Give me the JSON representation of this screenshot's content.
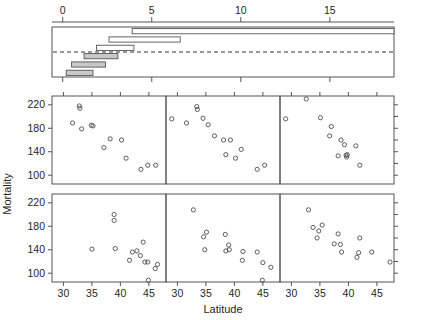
{
  "figure": {
    "type": "statistical-trellis-figure",
    "ylabel": "Mortality",
    "xlabel": "Latitude"
  },
  "chart_data": [
    {
      "type": "bar",
      "name": "interval-panel",
      "title": "",
      "xlabel": "",
      "ylabel": "",
      "xlim": [
        -0.6,
        18.6
      ],
      "xticks": [
        0,
        5,
        10,
        15
      ],
      "xtick_labels": [
        "0",
        "5",
        "10",
        "15"
      ],
      "grid": false,
      "reference_line": 3.5,
      "orientation": "horizontal",
      "note": "horizontal interval bars, three open above reference line and three shaded below",
      "categories": [
        "bar-1",
        "bar-2",
        "bar-3",
        "bar-4",
        "bar-5",
        "bar-6"
      ],
      "bars": [
        {
          "label": "bar-1",
          "row": 1,
          "start": 3.9,
          "end": 18.6,
          "filled": false
        },
        {
          "label": "bar-2",
          "row": 2,
          "start": 2.6,
          "end": 6.6,
          "filled": false
        },
        {
          "label": "bar-3",
          "row": 3,
          "start": 1.9,
          "end": 4.0,
          "filled": false
        },
        {
          "label": "bar-4",
          "row": 4,
          "start": 1.2,
          "end": 3.1,
          "filled": true
        },
        {
          "label": "bar-5",
          "row": 5,
          "start": 0.5,
          "end": 2.4,
          "filled": true
        },
        {
          "label": "bar-6",
          "row": 6,
          "start": 0.2,
          "end": 1.7,
          "filled": true
        }
      ]
    },
    {
      "type": "scatter",
      "name": "panel-top-left",
      "xlabel": "",
      "ylabel": "Mortality",
      "xlim": [
        28,
        48
      ],
      "ylim": [
        85,
        235
      ],
      "yticks": [
        100,
        140,
        180,
        220
      ],
      "ytick_labels": [
        "100",
        "140",
        "180",
        "220"
      ],
      "xticks": [
        30,
        35,
        40,
        45
      ],
      "xtick_labels": [
        "",
        "",
        "",
        ""
      ],
      "grid": false,
      "points": [
        {
          "x": 32.8,
          "y": 218
        },
        {
          "x": 32.9,
          "y": 214
        },
        {
          "x": 31.6,
          "y": 189
        },
        {
          "x": 33.2,
          "y": 179
        },
        {
          "x": 34.9,
          "y": 185
        },
        {
          "x": 35.2,
          "y": 184
        },
        {
          "x": 37.1,
          "y": 147
        },
        {
          "x": 38.2,
          "y": 162
        },
        {
          "x": 40.2,
          "y": 160
        },
        {
          "x": 41.0,
          "y": 129
        },
        {
          "x": 43.6,
          "y": 110
        },
        {
          "x": 44.8,
          "y": 117
        },
        {
          "x": 46.2,
          "y": 117
        }
      ]
    },
    {
      "type": "scatter",
      "name": "panel-top-middle",
      "xlabel": "",
      "ylabel": "",
      "xlim": [
        28,
        48
      ],
      "ylim": [
        85,
        235
      ],
      "yticks": [
        100,
        140,
        180,
        220
      ],
      "ytick_labels": [
        "",
        "",
        "",
        ""
      ],
      "xticks": [
        30,
        35,
        40,
        45
      ],
      "xtick_labels": [
        "",
        "",
        "",
        ""
      ],
      "grid": false,
      "points": [
        {
          "x": 33.4,
          "y": 217
        },
        {
          "x": 33.5,
          "y": 212
        },
        {
          "x": 29.0,
          "y": 196
        },
        {
          "x": 31.6,
          "y": 189
        },
        {
          "x": 34.5,
          "y": 197
        },
        {
          "x": 35.4,
          "y": 186
        },
        {
          "x": 36.5,
          "y": 167
        },
        {
          "x": 38.1,
          "y": 160
        },
        {
          "x": 38.5,
          "y": 135
        },
        {
          "x": 39.3,
          "y": 160
        },
        {
          "x": 40.2,
          "y": 129
        },
        {
          "x": 41.2,
          "y": 144
        },
        {
          "x": 44.0,
          "y": 110
        },
        {
          "x": 45.3,
          "y": 117
        }
      ]
    },
    {
      "type": "scatter",
      "name": "panel-top-right",
      "xlabel": "",
      "ylabel": "",
      "xlim": [
        28,
        48
      ],
      "ylim": [
        85,
        235
      ],
      "yticks": [
        100,
        140,
        180,
        220
      ],
      "ytick_labels": [
        "",
        "",
        "",
        ""
      ],
      "xticks": [
        30,
        35,
        40,
        45
      ],
      "xtick_labels": [
        "",
        "",
        "",
        ""
      ],
      "grid": false,
      "points": [
        {
          "x": 32.6,
          "y": 230
        },
        {
          "x": 29.0,
          "y": 196
        },
        {
          "x": 35.1,
          "y": 198
        },
        {
          "x": 37.0,
          "y": 183
        },
        {
          "x": 36.7,
          "y": 167
        },
        {
          "x": 38.7,
          "y": 160
        },
        {
          "x": 39.3,
          "y": 152
        },
        {
          "x": 41.3,
          "y": 150
        },
        {
          "x": 38.2,
          "y": 133
        },
        {
          "x": 39.6,
          "y": 134
        },
        {
          "x": 39.8,
          "y": 135
        },
        {
          "x": 39.7,
          "y": 131
        },
        {
          "x": 42.0,
          "y": 117
        }
      ]
    },
    {
      "type": "scatter",
      "name": "panel-bottom-left",
      "xlabel": "Latitude",
      "ylabel": "Mortality",
      "xlim": [
        28,
        48
      ],
      "ylim": [
        85,
        235
      ],
      "yticks": [
        100,
        140,
        180,
        220
      ],
      "ytick_labels": [
        "100",
        "140",
        "180",
        "220"
      ],
      "xticks": [
        30,
        35,
        40,
        45
      ],
      "xtick_labels": [
        "30",
        "35",
        "40",
        "45"
      ],
      "grid": false,
      "points": [
        {
          "x": 38.9,
          "y": 200
        },
        {
          "x": 38.9,
          "y": 190
        },
        {
          "x": 35.0,
          "y": 141
        },
        {
          "x": 39.1,
          "y": 142
        },
        {
          "x": 41.6,
          "y": 122
        },
        {
          "x": 42.1,
          "y": 136
        },
        {
          "x": 42.9,
          "y": 138
        },
        {
          "x": 43.5,
          "y": 130
        },
        {
          "x": 44.0,
          "y": 153
        },
        {
          "x": 44.3,
          "y": 119
        },
        {
          "x": 44.8,
          "y": 119
        },
        {
          "x": 44.9,
          "y": 88
        },
        {
          "x": 46.1,
          "y": 108
        },
        {
          "x": 46.5,
          "y": 115
        }
      ]
    },
    {
      "type": "scatter",
      "name": "panel-bottom-middle",
      "xlabel": "",
      "ylabel": "",
      "xlim": [
        28,
        48
      ],
      "ylim": [
        85,
        235
      ],
      "yticks": [
        100,
        140,
        180,
        220
      ],
      "ytick_labels": [
        "",
        "",
        "",
        ""
      ],
      "xticks": [
        30,
        35,
        40,
        45
      ],
      "xtick_labels": [
        "30",
        "35",
        "40",
        "45"
      ],
      "grid": false,
      "points": [
        {
          "x": 32.8,
          "y": 208
        },
        {
          "x": 34.6,
          "y": 162
        },
        {
          "x": 35.1,
          "y": 170
        },
        {
          "x": 34.8,
          "y": 140
        },
        {
          "x": 38.4,
          "y": 166
        },
        {
          "x": 38.5,
          "y": 138
        },
        {
          "x": 39.0,
          "y": 148
        },
        {
          "x": 39.1,
          "y": 140
        },
        {
          "x": 41.5,
          "y": 137
        },
        {
          "x": 41.4,
          "y": 122
        },
        {
          "x": 44.0,
          "y": 136
        },
        {
          "x": 44.9,
          "y": 88
        },
        {
          "x": 45.0,
          "y": 118
        },
        {
          "x": 46.4,
          "y": 110
        }
      ]
    },
    {
      "type": "scatter",
      "name": "panel-bottom-right",
      "xlabel": "",
      "ylabel": "",
      "xlim": [
        28,
        48
      ],
      "ylim": [
        85,
        235
      ],
      "yticks": [
        100,
        140,
        180,
        220
      ],
      "ytick_labels": [
        "",
        "",
        "",
        ""
      ],
      "xticks": [
        30,
        35,
        40,
        45
      ],
      "xtick_labels": [
        "30",
        "35",
        "40",
        "45"
      ],
      "grid": false,
      "points": [
        {
          "x": 33.0,
          "y": 208
        },
        {
          "x": 33.8,
          "y": 178
        },
        {
          "x": 34.8,
          "y": 172
        },
        {
          "x": 35.4,
          "y": 182
        },
        {
          "x": 34.5,
          "y": 160
        },
        {
          "x": 38.2,
          "y": 167
        },
        {
          "x": 37.5,
          "y": 150
        },
        {
          "x": 38.6,
          "y": 149
        },
        {
          "x": 38.8,
          "y": 136
        },
        {
          "x": 42.0,
          "y": 160
        },
        {
          "x": 41.5,
          "y": 127
        },
        {
          "x": 41.8,
          "y": 135
        },
        {
          "x": 44.1,
          "y": 136
        },
        {
          "x": 47.3,
          "y": 119
        }
      ]
    }
  ]
}
